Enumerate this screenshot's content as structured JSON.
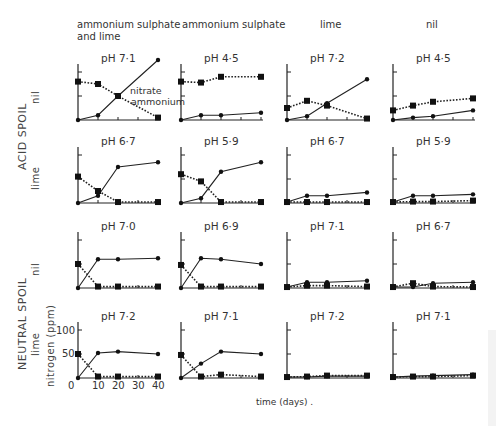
{
  "chart_data": {
    "type": "line",
    "title": "",
    "xlabel": "time (days) .",
    "ylabel": "nitrogen (ppm)",
    "x": [
      0,
      10,
      20,
      40
    ],
    "x_ticks": [
      "0",
      "10",
      "20",
      "30",
      "40"
    ],
    "y_ticks": [
      "50",
      "100"
    ],
    "ylim": [
      0,
      100
    ],
    "xlim": [
      0,
      40
    ],
    "legend_annotations": [
      "nitrate",
      "ammonium"
    ],
    "series_styles": {
      "nitrate": "solid line, round markers",
      "ammonium": "dotted line, square markers"
    },
    "columns": [
      "ammonium sulphate and lime",
      "ammonium sulphate",
      "lime",
      "nil"
    ],
    "row_groups": [
      {
        "label": "ACID SPOIL",
        "rows": [
          "nil",
          "lime"
        ]
      },
      {
        "label": "NEUTRAL SPOIL",
        "rows": [
          "nil",
          "lime"
        ]
      }
    ],
    "panels": [
      {
        "row": 0,
        "col": 0,
        "spoil": "ACID SPOIL",
        "treatment_row": "nil",
        "ph": "pH 7·1",
        "series": [
          {
            "name": "nitrate",
            "values": [
              0,
              10,
              50,
              125
            ]
          },
          {
            "name": "ammonium",
            "values": [
              80,
              75,
              50,
              5
            ]
          }
        ]
      },
      {
        "row": 0,
        "col": 1,
        "spoil": "ACID SPOIL",
        "treatment_row": "nil",
        "ph": "pH 4·5",
        "series": [
          {
            "name": "nitrate",
            "values": [
              0,
              10,
              10,
              15
            ]
          },
          {
            "name": "ammonium",
            "values": [
              80,
              78,
              90,
              90
            ]
          }
        ]
      },
      {
        "row": 0,
        "col": 2,
        "spoil": "ACID SPOIL",
        "treatment_row": "nil",
        "ph": "pH 7·2",
        "series": [
          {
            "name": "nitrate",
            "values": [
              0,
              8,
              35,
              85
            ]
          },
          {
            "name": "ammonium",
            "values": [
              25,
              40,
              30,
              3
            ]
          }
        ]
      },
      {
        "row": 0,
        "col": 3,
        "spoil": "ACID SPOIL",
        "treatment_row": "nil",
        "ph": "pH 4·5",
        "series": [
          {
            "name": "nitrate",
            "values": [
              0,
              5,
              8,
              20
            ]
          },
          {
            "name": "ammonium",
            "values": [
              20,
              30,
              38,
              45
            ]
          }
        ]
      },
      {
        "row": 1,
        "col": 0,
        "spoil": "ACID SPOIL",
        "treatment_row": "lime",
        "ph": "pH 6·7",
        "series": [
          {
            "name": "nitrate",
            "values": [
              0,
              15,
              75,
              85
            ]
          },
          {
            "name": "ammonium",
            "values": [
              55,
              25,
              2,
              2
            ]
          }
        ]
      },
      {
        "row": 1,
        "col": 1,
        "spoil": "ACID SPOIL",
        "treatment_row": "lime",
        "ph": "pH 5·9",
        "series": [
          {
            "name": "nitrate",
            "values": [
              0,
              10,
              65,
              85
            ]
          },
          {
            "name": "ammonium",
            "values": [
              60,
              45,
              2,
              2
            ]
          }
        ]
      },
      {
        "row": 1,
        "col": 2,
        "spoil": "ACID SPOIL",
        "treatment_row": "lime",
        "ph": "pH 6·7",
        "series": [
          {
            "name": "nitrate",
            "values": [
              2,
              15,
              15,
              22
            ]
          },
          {
            "name": "ammonium",
            "values": [
              2,
              2,
              2,
              2
            ]
          }
        ]
      },
      {
        "row": 1,
        "col": 3,
        "spoil": "ACID SPOIL",
        "treatment_row": "lime",
        "ph": "pH 5·9",
        "series": [
          {
            "name": "nitrate",
            "values": [
              2,
              15,
              15,
              18
            ]
          },
          {
            "name": "ammonium",
            "values": [
              2,
              3,
              3,
              5
            ]
          }
        ]
      },
      {
        "row": 2,
        "col": 0,
        "spoil": "NEUTRAL SPOIL",
        "treatment_row": "nil",
        "ph": "pH 7·0",
        "series": [
          {
            "name": "nitrate",
            "values": [
              0,
              60,
              60,
              62
            ]
          },
          {
            "name": "ammonium",
            "values": [
              50,
              3,
              3,
              3
            ]
          }
        ]
      },
      {
        "row": 2,
        "col": 1,
        "spoil": "NEUTRAL SPOIL",
        "treatment_row": "nil",
        "ph": "pH 6·9",
        "series": [
          {
            "name": "nitrate",
            "values": [
              0,
              62,
              60,
              50
            ]
          },
          {
            "name": "ammonium",
            "values": [
              48,
              3,
              3,
              3
            ]
          }
        ]
      },
      {
        "row": 2,
        "col": 2,
        "spoil": "NEUTRAL SPOIL",
        "treatment_row": "nil",
        "ph": "pH 7·1",
        "series": [
          {
            "name": "nitrate",
            "values": [
              2,
              12,
              12,
              15
            ]
          },
          {
            "name": "ammonium",
            "values": [
              2,
              5,
              5,
              3
            ]
          }
        ]
      },
      {
        "row": 2,
        "col": 3,
        "spoil": "NEUTRAL SPOIL",
        "treatment_row": "nil",
        "ph": "pH 6·7",
        "series": [
          {
            "name": "nitrate",
            "values": [
              2,
              2,
              10,
              12
            ]
          },
          {
            "name": "ammonium",
            "values": [
              2,
              10,
              3,
              2
            ]
          }
        ]
      },
      {
        "row": 3,
        "col": 0,
        "spoil": "NEUTRAL SPOIL",
        "treatment_row": "lime",
        "ph": "pH 7·2",
        "series": [
          {
            "name": "nitrate",
            "values": [
              0,
              52,
              55,
              50
            ]
          },
          {
            "name": "ammonium",
            "values": [
              50,
              3,
              3,
              3
            ]
          }
        ]
      },
      {
        "row": 3,
        "col": 1,
        "spoil": "NEUTRAL SPOIL",
        "treatment_row": "lime",
        "ph": "pH 7·1",
        "series": [
          {
            "name": "nitrate",
            "values": [
              0,
              30,
              55,
              50
            ]
          },
          {
            "name": "ammonium",
            "values": [
              48,
              3,
              7,
              3
            ]
          }
        ]
      },
      {
        "row": 3,
        "col": 2,
        "spoil": "NEUTRAL SPOIL",
        "treatment_row": "lime",
        "ph": "pH 7·2",
        "series": [
          {
            "name": "nitrate",
            "values": [
              2,
              2,
              4,
              4
            ]
          },
          {
            "name": "ammonium",
            "values": [
              2,
              3,
              5,
              5
            ]
          }
        ]
      },
      {
        "row": 3,
        "col": 3,
        "spoil": "NEUTRAL SPOIL",
        "treatment_row": "lime",
        "ph": "pH 7·1",
        "series": [
          {
            "name": "nitrate",
            "values": [
              2,
              4,
              5,
              7
            ]
          },
          {
            "name": "ammonium",
            "values": [
              2,
              3,
              3,
              5
            ]
          }
        ]
      }
    ]
  },
  "labels": {
    "col_titles": [
      "ammonium sulphate\nand lime",
      "ammonium sulphate",
      "lime",
      "nil"
    ],
    "acid_spoil": "ACID  SPOIL",
    "neutral_spoil": "NEUTRAL  SPOIL",
    "row_nil": "nil",
    "row_lime": "lime",
    "ylabel": "nitrogen (ppm)",
    "xlabel": "time (days) .",
    "annot_nitrate": "nitrate",
    "annot_ammonium": "ammonium",
    "y100": "100",
    "y50": "50",
    "x0": "0",
    "x10": "10",
    "x20": "20",
    "x30": "30",
    "x40": "40"
  }
}
